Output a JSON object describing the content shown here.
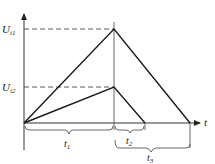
{
  "diagram": {
    "type": "voltage-time waveform",
    "y_axis": {
      "labels": [
        {
          "main": "U",
          "sub": "i1",
          "y": 29
        },
        {
          "main": "U",
          "sub": "i2",
          "y": 87
        }
      ]
    },
    "x_axis": {
      "label": "t"
    },
    "intervals": [
      {
        "main": "t",
        "sub": "1"
      },
      {
        "main": "t",
        "sub": "2"
      },
      {
        "main": "t",
        "sub": "3"
      }
    ],
    "colors": {
      "line": "#1a1a1a",
      "axis": "#333333",
      "dashed": "#444444",
      "background": "#ffffff"
    }
  }
}
